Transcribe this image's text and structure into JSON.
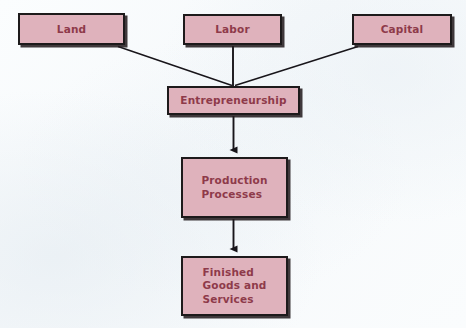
{
  "diagram": {
    "type": "flowchart",
    "background_color": "#fafcfe",
    "node_fill_color": "#dfb2bc",
    "node_border_color": "#1d1a1b",
    "node_text_color": "#8e3a4a",
    "connector_color": "#18151a",
    "nodes": [
      {
        "id": "land",
        "label": "Land"
      },
      {
        "id": "labor",
        "label": "Labor"
      },
      {
        "id": "capital",
        "label": "Capital"
      },
      {
        "id": "entrepreneurship",
        "label": "Entrepreneurship"
      },
      {
        "id": "production",
        "label": "Production\nProcesses"
      },
      {
        "id": "finished",
        "label": "Finished\nGoods and\nServices"
      }
    ],
    "connectors": [
      {
        "id": "land-to-entrepreneurship",
        "from": "land",
        "to": "entrepreneurship",
        "style": "diagonal-line",
        "arrowhead": false
      },
      {
        "id": "labor-to-entrepreneurship",
        "from": "labor",
        "to": "entrepreneurship",
        "style": "vertical-line",
        "arrowhead": false
      },
      {
        "id": "capital-to-entrepreneurship",
        "from": "capital",
        "to": "entrepreneurship",
        "style": "diagonal-line",
        "arrowhead": false
      },
      {
        "id": "entrepreneurship-to-production",
        "from": "entrepreneurship",
        "to": "production",
        "style": "vertical-line",
        "arrowhead": true
      },
      {
        "id": "production-to-finished",
        "from": "production",
        "to": "finished",
        "style": "vertical-line",
        "arrowhead": true
      }
    ]
  }
}
